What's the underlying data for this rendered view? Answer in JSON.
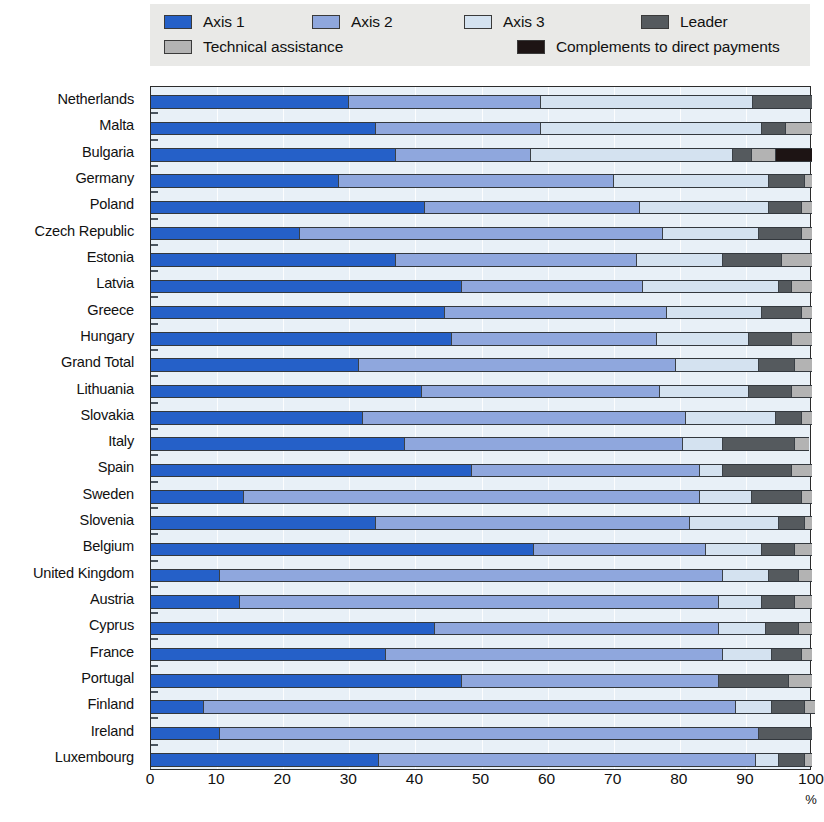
{
  "legend": {
    "items": [
      {
        "label": "Axis 1",
        "color": "#2560c8",
        "name": "legend-axis-1"
      },
      {
        "label": "Axis 2",
        "color": "#8fa7dd",
        "name": "legend-axis-2"
      },
      {
        "label": "Axis 3",
        "color": "#d4e2f0",
        "name": "legend-axis-3"
      },
      {
        "label": "Leader",
        "color": "#555a5e",
        "name": "legend-leader"
      },
      {
        "label": "Technical assistance",
        "color": "#b3b3b3",
        "name": "legend-technical-assistance"
      },
      {
        "label": "Complements to direct payments",
        "color": "#1d1414",
        "name": "legend-complements"
      }
    ]
  },
  "axis": {
    "unit": "%",
    "ticks": [
      "0",
      "10",
      "20",
      "30",
      "40",
      "50",
      "60",
      "70",
      "80",
      "90",
      "100"
    ]
  },
  "chart_data": {
    "type": "bar",
    "orientation": "horizontal",
    "stacked": true,
    "title": "",
    "xlabel": "%",
    "ylabel": "",
    "xlim": [
      0,
      100
    ],
    "grid": true,
    "legend_position": "top",
    "series_names": [
      "Axis 1",
      "Axis 2",
      "Axis 3",
      "Leader",
      "Technical assistance",
      "Complements to direct payments"
    ],
    "series_colors": [
      "#2560c8",
      "#8fa7dd",
      "#d4e2f0",
      "#555a5e",
      "#b3b3b3",
      "#1d1414"
    ],
    "categories": [
      "Netherlands",
      "Malta",
      "Bulgaria",
      "Germany",
      "Poland",
      "Czech Republic",
      "Estonia",
      "Latvia",
      "Greece",
      "Hungary",
      "Grand Total",
      "Lithuania",
      "Slovakia",
      "Italy",
      "Spain",
      "Sweden",
      "Slovenia",
      "Belgium",
      "United Kingdom",
      "Austria",
      "Cyprus",
      "France",
      "Portugal",
      "Finland",
      "Ireland",
      "Luxembourg"
    ],
    "series": [
      {
        "name": "Axis 1",
        "values": [
          30.0,
          34.0,
          37.0,
          28.5,
          41.5,
          22.5,
          37.0,
          47.0,
          44.5,
          45.5,
          31.5,
          41.0,
          32.0,
          38.5,
          48.5,
          14.0,
          34.0,
          58.0,
          10.5,
          13.5,
          43.0,
          35.5,
          47.0,
          8.0,
          10.5,
          34.5
        ]
      },
      {
        "name": "Axis 2",
        "values": [
          29.0,
          25.0,
          20.5,
          41.5,
          32.5,
          55.0,
          36.5,
          27.5,
          33.5,
          31.0,
          48.0,
          36.0,
          49.0,
          42.0,
          34.5,
          69.0,
          47.5,
          26.0,
          76.0,
          72.5,
          43.0,
          51.0,
          39.0,
          80.5,
          81.5,
          57.0
        ]
      },
      {
        "name": "Axis 3",
        "values": [
          32.0,
          33.5,
          30.5,
          23.5,
          19.5,
          14.5,
          13.0,
          20.5,
          14.5,
          14.0,
          12.5,
          13.5,
          13.5,
          6.0,
          3.5,
          8.0,
          13.5,
          8.5,
          7.0,
          6.5,
          7.0,
          7.5,
          0.0,
          5.5,
          0.0,
          3.5
        ]
      },
      {
        "name": "Leader",
        "values": [
          9.0,
          3.5,
          3.0,
          5.5,
          5.0,
          6.5,
          9.0,
          2.0,
          6.0,
          6.5,
          5.5,
          6.5,
          4.0,
          11.0,
          10.5,
          7.5,
          4.0,
          5.0,
          4.5,
          5.0,
          5.0,
          4.5,
          10.5,
          5.0,
          8.0,
          4.0
        ]
      },
      {
        "name": "Technical assistance",
        "values": [
          0.0,
          4.0,
          3.5,
          1.0,
          1.5,
          1.5,
          4.5,
          3.0,
          1.5,
          3.0,
          2.5,
          3.0,
          1.5,
          2.0,
          3.0,
          1.5,
          1.0,
          2.5,
          2.0,
          2.5,
          2.0,
          1.5,
          3.5,
          1.5,
          0.0,
          1.0
        ]
      },
      {
        "name": "Complements to direct payments",
        "values": [
          0.0,
          0.0,
          5.5,
          0.0,
          0.0,
          0.0,
          0.0,
          0.0,
          0.0,
          0.0,
          0.0,
          0.0,
          0.0,
          0.0,
          0.0,
          0.0,
          0.0,
          0.0,
          0.0,
          0.0,
          0.0,
          0.0,
          0.0,
          0.0,
          0.0,
          0.0
        ]
      }
    ]
  }
}
